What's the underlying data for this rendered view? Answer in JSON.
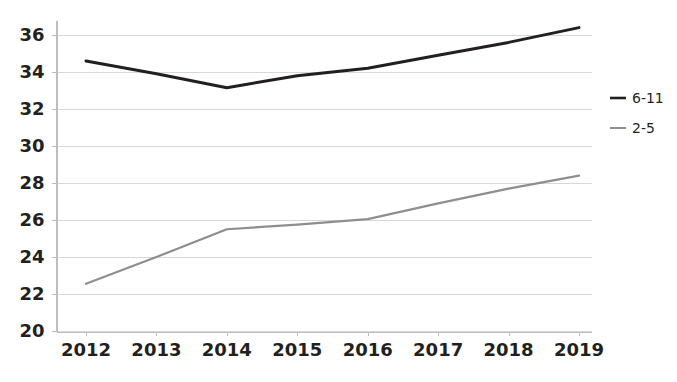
{
  "chart_data": {
    "type": "line",
    "title": "",
    "subtitle": "",
    "xlabel": "",
    "ylabel": "",
    "categories": [
      "2012",
      "2013",
      "2014",
      "2015",
      "2016",
      "2017",
      "2018",
      "2019"
    ],
    "x": [
      2012,
      2013,
      2014,
      2015,
      2016,
      2017,
      2018,
      2019
    ],
    "series": [
      {
        "name": "6-11",
        "color": "#231f20",
        "values": [
          34.6,
          33.9,
          33.15,
          33.8,
          34.2,
          34.9,
          35.6,
          36.4
        ]
      },
      {
        "name": "2-5",
        "color": "#8e8e8e",
        "values": [
          22.55,
          24.0,
          25.5,
          25.75,
          26.05,
          26.9,
          27.7,
          28.4
        ]
      }
    ],
    "ylim": [
      20,
      36
    ],
    "yticks": [
      20,
      22,
      24,
      26,
      28,
      30,
      32,
      34,
      36
    ],
    "ytick_labels": [
      "20",
      "22",
      "24",
      "26",
      "28",
      "30",
      "32",
      "34",
      "36"
    ],
    "grid": true,
    "grid_axis": "y",
    "legend_position": "right",
    "legend": [
      {
        "label": "6-11",
        "color": "#231f20"
      },
      {
        "label": "2-5",
        "color": "#8e8e8e"
      }
    ]
  },
  "axes": {
    "y_axis_name": "y-axis",
    "x_axis_name": "x-axis"
  }
}
